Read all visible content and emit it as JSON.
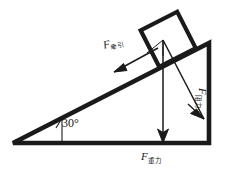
{
  "figure": {
    "name": "inclined-plane-free-body-diagram",
    "background_color": "#ffffff",
    "stroke_color": "#1a1a1a"
  },
  "incline": {
    "angle_label": "30°",
    "angle_value": 30,
    "base_left": [
      13,
      143
    ],
    "base_right": [
      209,
      143
    ],
    "apex_top": [
      209,
      43
    ]
  },
  "block": {
    "name": "block-on-incline",
    "description": "square block resting on the inclined surface"
  },
  "forces": [
    {
      "id": "applied",
      "symbol": "F",
      "subscript": "牵引",
      "direction": "down-left along incline",
      "label_rotation_deg": -13
    },
    {
      "id": "gravity",
      "symbol": "F",
      "subscript": "重力",
      "direction": "vertically downward",
      "label_rotation_deg": 0
    },
    {
      "id": "resistance",
      "symbol": "F",
      "subscript": "阻力",
      "direction": "down-right toward incline base",
      "label_rotation_deg": 90
    }
  ]
}
